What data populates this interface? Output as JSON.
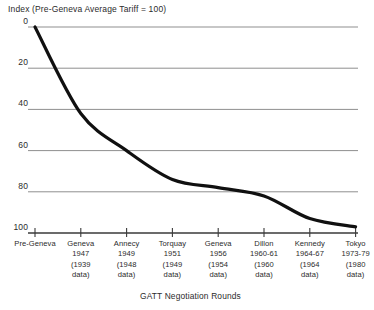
{
  "chart_data": {
    "type": "line",
    "title": "Index (Pre-Geneva Average Tariff = 100)",
    "xlabel": "GATT Negotiation Rounds",
    "ylabel": "",
    "ylim": [
      0,
      100
    ],
    "yticks": [
      0,
      20,
      40,
      60,
      80,
      100
    ],
    "grid": true,
    "legend": false,
    "categories": [
      "Pre-Geneva",
      "Geneva 1947 (1939 data)",
      "Annecy 1949 (1948 data)",
      "Torquay 1951 (1949 data)",
      "Geneva 1956 (1954 data)",
      "Dillon 1960-61 (1960 data)",
      "Kennedy 1964-67 (1964 data)",
      "Tokyo 1973-79 (1980 data)"
    ],
    "values": [
      100,
      58,
      40,
      26,
      22,
      18,
      7,
      3
    ],
    "line_color": "#101010",
    "grid_color": "#8f8f8f"
  },
  "axis": {
    "yticks": [
      {
        "label": "100"
      },
      {
        "label": "80"
      },
      {
        "label": "60"
      },
      {
        "label": "40"
      },
      {
        "label": "20"
      },
      {
        "label": "0"
      }
    ],
    "xticks": [
      {
        "lines": [
          "Pre-Geneva"
        ]
      },
      {
        "lines": [
          "Geneva",
          "1947",
          "(1939",
          "data)"
        ]
      },
      {
        "lines": [
          "Annecy",
          "1949",
          "(1948",
          "data)"
        ]
      },
      {
        "lines": [
          "Torquay",
          "1951",
          "(1949",
          "data)"
        ]
      },
      {
        "lines": [
          "Geneva",
          "1956",
          "(1954",
          "data)"
        ]
      },
      {
        "lines": [
          "Dillon",
          "1960-61",
          "(1960",
          "data)"
        ]
      },
      {
        "lines": [
          "Kennedy",
          "1964-67",
          "(1964",
          "data)"
        ]
      },
      {
        "lines": [
          "Tokyo",
          "1973-79",
          "(1980",
          "data)"
        ]
      }
    ]
  }
}
